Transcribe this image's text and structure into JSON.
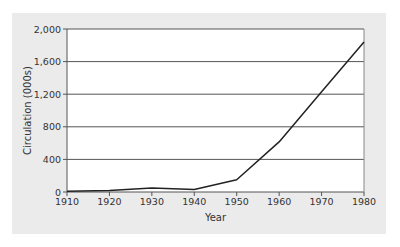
{
  "chart_data": {
    "type": "line",
    "title": "",
    "xlabel": "Year",
    "ylabel": "Circulation (000s)",
    "x": [
      1910,
      1920,
      1930,
      1940,
      1950,
      1960,
      1970,
      1980
    ],
    "series": [
      {
        "name": "Circulation",
        "values": [
          10,
          20,
          50,
          30,
          150,
          615,
          1230,
          1840
        ]
      }
    ],
    "ylim": [
      0,
      2000
    ],
    "xlim": [
      1910,
      1980
    ],
    "yticks": [
      0,
      400,
      800,
      1200,
      1600,
      2000
    ],
    "ytick_labels": [
      "0",
      "400",
      "800",
      "1,200",
      "1,600",
      "2,000"
    ],
    "xticks": [
      1910,
      1920,
      1930,
      1940,
      1950,
      1960,
      1970,
      1980
    ],
    "xtick_labels": [
      "1910",
      "1920",
      "1930",
      "1940",
      "1950",
      "1960",
      "1970",
      "1980"
    ],
    "grid": "horizontal",
    "legend": "none"
  },
  "colors": {
    "panel": "#ebebeb",
    "plot_bg": "#ffffff",
    "line": "#222222",
    "grid": "#555555"
  }
}
